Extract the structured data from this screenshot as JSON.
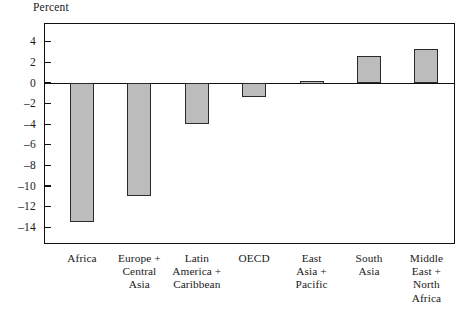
{
  "chart_data": {
    "type": "bar",
    "title": "",
    "xlabel": "",
    "ylabel": "Percent",
    "ylim": [
      -15.6,
      5.8
    ],
    "yticks": [
      4,
      2,
      0,
      -2,
      -4,
      -6,
      -8,
      -10,
      -12,
      -14
    ],
    "ytick_labels": [
      "4",
      "2",
      "0",
      "–2",
      "–4",
      "–6",
      "–8",
      "–10",
      "–12",
      "–14"
    ],
    "grid": false,
    "legend": false,
    "bar_color": "#bcbcbc",
    "bar_edge_color": "#2a2a2a",
    "axis_color": "#111111",
    "categories": [
      "Africa",
      "Europe + Central Asia",
      "Latin America + Caribbean",
      "OECD",
      "East Asia + Pacific",
      "South Asia",
      "Middle East + North Africa"
    ],
    "category_lines": [
      [
        "Africa"
      ],
      [
        "Europe +",
        "Central",
        "Asia"
      ],
      [
        "Latin",
        "America +",
        "Caribbean"
      ],
      [
        "OECD"
      ],
      [
        "East",
        "Asia +",
        "Pacific"
      ],
      [
        "South",
        "Asia"
      ],
      [
        "Middle",
        "East +",
        "North",
        "Africa"
      ]
    ],
    "values": [
      -13.5,
      -11.0,
      -4.0,
      -1.4,
      0.15,
      2.6,
      3.3
    ]
  }
}
